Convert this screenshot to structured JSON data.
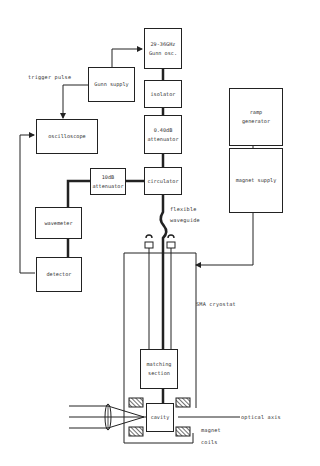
{
  "diagram": {
    "title": "",
    "blocks": {
      "gunn_osc": {
        "line1": "29-36GHz",
        "line2": "Gunn osc."
      },
      "gunn_supply": {
        "line1": "Gunn supply"
      },
      "isolator": {
        "line1": "isolator"
      },
      "attenuator_var": {
        "line1": "0.40dB",
        "line2": "attenuator"
      },
      "circulator": {
        "line1": "circulator"
      },
      "attenuator_10db": {
        "line1": "10dB",
        "line2": "attenuator"
      },
      "oscilloscope": {
        "line1": "oscilloscope"
      },
      "wavemeter": {
        "line1": "wavemeter"
      },
      "detector": {
        "line1": "detector"
      },
      "ramp_generator": {
        "line1": "ramp",
        "line2": "generator"
      },
      "magnet_supply": {
        "line1": "magnet supply"
      },
      "matching_section": {
        "line1": "matching",
        "line2": "section"
      },
      "cavity": {
        "line1": "cavity"
      }
    },
    "labels": {
      "trigger_pulse": "trigger pulse",
      "flexible_waveguide_1": "flexible",
      "flexible_waveguide_2": "waveguide",
      "cryostat": "SMA cryostat",
      "optical_axis": "optical axis",
      "magnet_coils_1": "magnet",
      "magnet_coils_2": "coils"
    },
    "colors": {
      "line": "#222222",
      "background": "#ffffff",
      "text": "#333333"
    }
  }
}
